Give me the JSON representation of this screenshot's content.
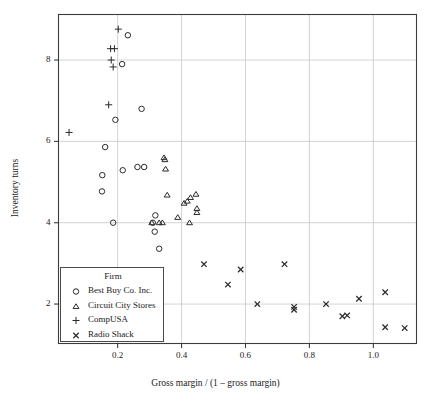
{
  "chart_data": {
    "type": "scatter",
    "title": "",
    "xlabel": "Gross margin / (1 – gross margin)",
    "ylabel": "Inventory turns",
    "xlim": [
      0.015,
      1.135
    ],
    "ylim": [
      1.03,
      9.12
    ],
    "xticks": [
      0.2,
      0.4,
      0.6,
      0.8,
      1.0
    ],
    "xtick_labels": [
      "0.2",
      "0.4",
      "0.6",
      "0.8",
      "1.0"
    ],
    "yticks": [
      2,
      4,
      6,
      8
    ],
    "ytick_labels": [
      "2",
      "4",
      "6",
      "8"
    ],
    "grid": true,
    "grid_color": "#c8c8c8",
    "frame_color": "#3c3c3c",
    "marker_color": "#2b2b2b",
    "legend": {
      "title": "Firm",
      "position": "bottom-left",
      "entries": [
        {
          "label": "Best Buy Co. Inc.",
          "marker": "circle"
        },
        {
          "label": "Circuit City Stores",
          "marker": "triangle"
        },
        {
          "label": "CompUSA",
          "marker": "plus"
        },
        {
          "label": "Radio Shack",
          "marker": "cross"
        }
      ]
    },
    "series": [
      {
        "name": "Best Buy Co. Inc.",
        "marker": "circle",
        "points": [
          [
            0.232,
            8.61
          ],
          [
            0.214,
            7.9
          ],
          [
            0.275,
            6.8
          ],
          [
            0.193,
            6.53
          ],
          [
            0.161,
            5.86
          ],
          [
            0.152,
            5.17
          ],
          [
            0.216,
            5.29
          ],
          [
            0.151,
            4.77
          ],
          [
            0.262,
            5.37
          ],
          [
            0.283,
            5.37
          ],
          [
            0.186,
            4.0
          ],
          [
            0.318,
            4.18
          ],
          [
            0.31,
            4.0
          ],
          [
            0.316,
            3.78
          ],
          [
            0.33,
            3.36
          ]
        ]
      },
      {
        "name": "Circuit City Stores",
        "marker": "triangle",
        "points": [
          [
            0.345,
            5.6
          ],
          [
            0.348,
            5.55
          ],
          [
            0.35,
            5.32
          ],
          [
            0.355,
            4.68
          ],
          [
            0.408,
            4.48
          ],
          [
            0.418,
            4.53
          ],
          [
            0.428,
            4.62
          ],
          [
            0.445,
            4.7
          ],
          [
            0.448,
            4.35
          ],
          [
            0.448,
            4.25
          ],
          [
            0.388,
            4.13
          ],
          [
            0.307,
            4.0
          ],
          [
            0.33,
            4.0
          ],
          [
            0.34,
            4.0
          ],
          [
            0.425,
            4.0
          ]
        ]
      },
      {
        "name": "CompUSA",
        "marker": "plus",
        "points": [
          [
            0.202,
            8.76
          ],
          [
            0.178,
            8.28
          ],
          [
            0.19,
            8.28
          ],
          [
            0.18,
            8.0
          ],
          [
            0.186,
            7.83
          ],
          [
            0.172,
            6.9
          ],
          [
            0.048,
            6.22
          ]
        ]
      },
      {
        "name": "Radio Shack",
        "marker": "cross",
        "points": [
          [
            0.47,
            2.98
          ],
          [
            0.585,
            2.85
          ],
          [
            0.545,
            2.48
          ],
          [
            0.722,
            2.98
          ],
          [
            0.637,
            2.0
          ],
          [
            0.752,
            1.93
          ],
          [
            0.752,
            1.86
          ],
          [
            0.852,
            2.0
          ],
          [
            0.955,
            2.13
          ],
          [
            1.037,
            2.29
          ],
          [
            0.903,
            1.7
          ],
          [
            0.918,
            1.72
          ],
          [
            1.037,
            1.43
          ],
          [
            1.098,
            1.41
          ]
        ]
      }
    ]
  }
}
